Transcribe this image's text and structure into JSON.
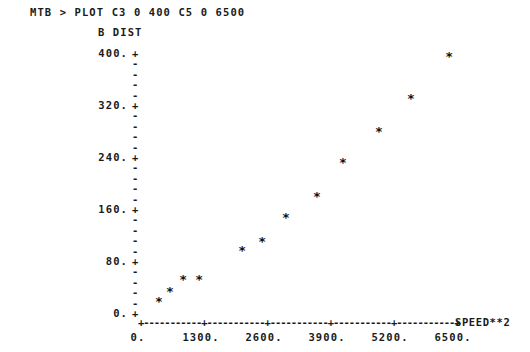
{
  "terminal": {
    "prompt": "MTB >",
    "command": "PLOT C3 0 400 C5 0 6500",
    "command_line": "MTB > PLOT C3 0 400 C5 0 6500"
  },
  "chart_data": {
    "type": "scatter",
    "title": "",
    "ylabel": "B DIST",
    "xlabel": "SPEED**2",
    "xlim": [
      0,
      6500
    ],
    "ylim": [
      0,
      400
    ],
    "grid": false,
    "legend": null,
    "marker": "*",
    "xticks": [
      0,
      1300,
      2600,
      3900,
      5200,
      6500
    ],
    "xtick_labels": [
      "0.",
      "1300.",
      "2600.",
      "3900.",
      "5200.",
      "6500."
    ],
    "yticks": [
      0,
      80,
      160,
      240,
      320,
      400
    ],
    "ytick_labels": [
      "0.",
      "80.",
      "160.",
      "240.",
      "320.",
      "400."
    ],
    "axis_tick_char": "+",
    "axis_minor_char": "-",
    "y_minor_per_interval": 4,
    "points": [
      {
        "x": 430,
        "y": 18
      },
      {
        "x": 660,
        "y": 34
      },
      {
        "x": 930,
        "y": 52
      },
      {
        "x": 1260,
        "y": 52
      },
      {
        "x": 2150,
        "y": 97
      },
      {
        "x": 2560,
        "y": 111
      },
      {
        "x": 3050,
        "y": 148
      },
      {
        "x": 3690,
        "y": 180
      },
      {
        "x": 4230,
        "y": 232
      },
      {
        "x": 4970,
        "y": 280
      },
      {
        "x": 5630,
        "y": 331
      },
      {
        "x": 6420,
        "y": 395
      }
    ]
  },
  "style": {
    "background": "#ffffff",
    "ink": "#1a1a1a",
    "marker_color": "#111111"
  }
}
